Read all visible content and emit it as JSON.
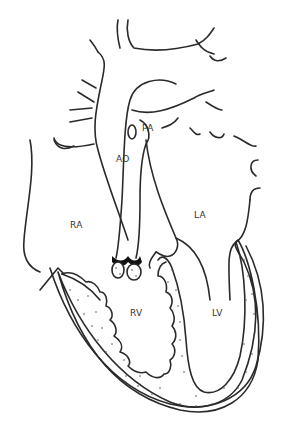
{
  "diagram": {
    "labels": {
      "pa": "PA",
      "ao": "AO",
      "ra": "RA",
      "la": "LA",
      "rv": "RV",
      "lv": "LV"
    },
    "colors": {
      "line": "#2a2a2a",
      "background": "#ffffff",
      "myocardium_dots": "#555555",
      "valve": "#111111"
    }
  }
}
